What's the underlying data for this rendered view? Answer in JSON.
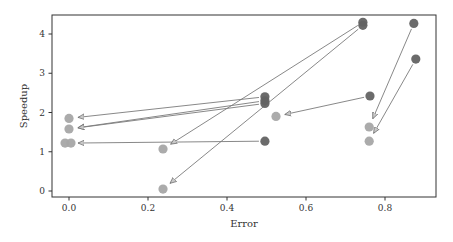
{
  "chart_data": {
    "type": "scatter",
    "title": "",
    "xlabel": "Error",
    "ylabel": "Speedup",
    "xlim": [
      -0.04,
      0.91
    ],
    "ylim": [
      -0.1,
      4.5
    ],
    "xticks": [
      0.0,
      0.2,
      0.4,
      0.6,
      0.8
    ],
    "xtick_labels": [
      "0.0",
      "0.2",
      "0.4",
      "0.6",
      "0.8"
    ],
    "yticks": [
      0,
      1,
      2,
      3,
      4
    ],
    "ytick_labels": [
      "0",
      "1",
      "2",
      "3",
      "4"
    ],
    "grid": false,
    "legend": null,
    "colors": {
      "source": "#636363",
      "target": "#a6a6a6",
      "arrow": "#7a7a7a",
      "axis": "#333333"
    },
    "series": [
      {
        "name": "source",
        "points": [
          {
            "x": 0.496,
            "y": 2.4
          },
          {
            "x": 0.496,
            "y": 2.3
          },
          {
            "x": 0.496,
            "y": 2.23
          },
          {
            "x": 0.496,
            "y": 1.27
          },
          {
            "x": 0.744,
            "y": 4.3
          },
          {
            "x": 0.744,
            "y": 4.22
          },
          {
            "x": 0.762,
            "y": 2.42
          },
          {
            "x": 0.873,
            "y": 4.27
          },
          {
            "x": 0.878,
            "y": 3.36
          }
        ]
      },
      {
        "name": "target",
        "points": [
          {
            "x": 0.0,
            "y": 1.85
          },
          {
            "x": 0.0,
            "y": 1.58
          },
          {
            "x": -0.01,
            "y": 1.22
          },
          {
            "x": 0.005,
            "y": 1.22
          },
          {
            "x": 0.238,
            "y": 1.07
          },
          {
            "x": 0.238,
            "y": 0.05
          },
          {
            "x": 0.524,
            "y": 1.9
          },
          {
            "x": 0.76,
            "y": 1.63
          },
          {
            "x": 0.76,
            "y": 1.27
          }
        ]
      }
    ],
    "arrows": [
      {
        "from": [
          0.496,
          2.4
        ],
        "to": [
          0.0,
          1.85
        ]
      },
      {
        "from": [
          0.496,
          2.3
        ],
        "to": [
          0.0,
          1.58
        ]
      },
      {
        "from": [
          0.496,
          2.23
        ],
        "to": [
          0.0,
          1.58
        ]
      },
      {
        "from": [
          0.496,
          1.27
        ],
        "to": [
          0.0,
          1.22
        ]
      },
      {
        "from": [
          0.744,
          4.3
        ],
        "to": [
          0.238,
          1.07
        ]
      },
      {
        "from": [
          0.744,
          4.22
        ],
        "to": [
          0.238,
          0.05
        ]
      },
      {
        "from": [
          0.762,
          2.42
        ],
        "to": [
          0.524,
          1.9
        ]
      },
      {
        "from": [
          0.873,
          4.27
        ],
        "to": [
          0.76,
          1.63
        ]
      },
      {
        "from": [
          0.878,
          3.36
        ],
        "to": [
          0.76,
          1.27
        ]
      }
    ]
  }
}
